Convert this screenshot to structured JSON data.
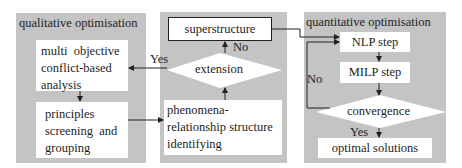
{
  "panels": {
    "qualitative": {
      "title": "qualitative optimisation",
      "boxes": [
        {
          "lines": [
            "multi  objective",
            "conflict-based",
            "analysis"
          ]
        },
        {
          "lines": [
            "principles",
            "screening  and",
            "grouping"
          ]
        }
      ]
    },
    "middle": {
      "superstructure": "superstructure",
      "decision": "extension",
      "phenomena_lines": [
        "phenomena-",
        "relationship structure",
        "identifying"
      ],
      "no_label": "No",
      "yes_label": "Yes"
    },
    "quantitative": {
      "title": "quantitative optimisation",
      "nlp": "NLP step",
      "milp": "MILP step",
      "decision": "convergence",
      "result": "optimal solutions",
      "no_label": "No",
      "yes_label": "Yes"
    }
  },
  "colors": {
    "panel_bg": "#c4c4c4",
    "box_bg": "#ffffff",
    "line": "#222222"
  }
}
